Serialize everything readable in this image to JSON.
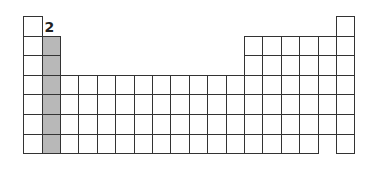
{
  "diagram": {
    "type": "periodic-table-outline",
    "highlight_label": "2",
    "highlighted_group": 2,
    "colors": {
      "cell_border": "#333333",
      "cell_fill": "#ffffff",
      "highlight_fill": "#b8b8b8"
    },
    "layout": {
      "origin_x": 23,
      "origin_y": 16,
      "cell_w": 18.4,
      "cell_h": 19.55,
      "columns": 18,
      "rows": 7
    },
    "rows": [
      {
        "period": 1,
        "groups": [
          1,
          18
        ]
      },
      {
        "period": 2,
        "groups": [
          1,
          2,
          13,
          14,
          15,
          16,
          17,
          18
        ]
      },
      {
        "period": 3,
        "groups": [
          1,
          2,
          13,
          14,
          15,
          16,
          17,
          18
        ]
      },
      {
        "period": 4,
        "groups": [
          1,
          2,
          3,
          4,
          5,
          6,
          7,
          8,
          9,
          10,
          11,
          12,
          13,
          14,
          15,
          16,
          17,
          18
        ]
      },
      {
        "period": 5,
        "groups": [
          1,
          2,
          3,
          4,
          5,
          6,
          7,
          8,
          9,
          10,
          11,
          12,
          13,
          14,
          15,
          16,
          17,
          18
        ]
      },
      {
        "period": 6,
        "groups": [
          1,
          2,
          3,
          4,
          5,
          6,
          7,
          8,
          9,
          10,
          11,
          12,
          13,
          14,
          15,
          16,
          17,
          18
        ]
      },
      {
        "period": 7,
        "groups": [
          1,
          2,
          3,
          4,
          5,
          6,
          7,
          8,
          9,
          10,
          11,
          12,
          13,
          14,
          15,
          16,
          18
        ]
      }
    ]
  }
}
